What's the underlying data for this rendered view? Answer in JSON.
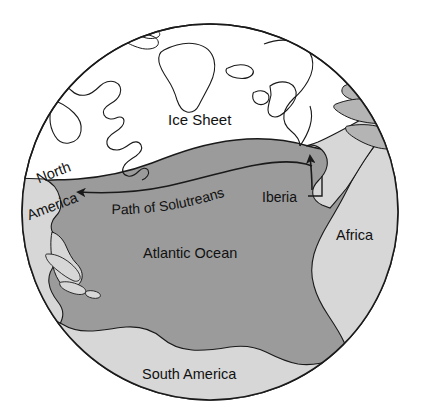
{
  "figure": {
    "kind": "globe-map",
    "projection": "orthographic",
    "view_center": "North Atlantic Ocean",
    "background_color": "#ffffff",
    "outline_color": "#1a1a1a"
  },
  "colors": {
    "ocean": "#9b9b9b",
    "land": "#d7d7d7",
    "ice_sheet": "#ffffff",
    "outline": "#1a1a1a",
    "label_text": "#111111"
  },
  "labels": {
    "ice_sheet": "Ice Sheet",
    "atlantic_ocean": "Atlantic Ocean",
    "south_america": "South America",
    "africa": "Africa",
    "iberia": "Iberia",
    "north_america_line1": "North",
    "north_america_line2": "America",
    "path_of_solutreans": "Path of Solutreans"
  },
  "features": {
    "ice_sheet": {
      "name": "Ice Sheet",
      "fill": "#ffffff",
      "description": "Last Glacial Maximum ice sheet spanning the northern North Atlantic"
    },
    "ocean": {
      "name": "Atlantic Ocean",
      "fill": "#9b9b9b"
    },
    "landmasses": [
      {
        "name": "North America",
        "fill": "#d7d7d7"
      },
      {
        "name": "South America",
        "fill": "#d7d7d7"
      },
      {
        "name": "Africa",
        "fill": "#d7d7d7"
      },
      {
        "name": "Iberia",
        "fill": "#d7d7d7"
      }
    ],
    "migration_route": {
      "name": "Path of Solutreans",
      "from": "Iberia",
      "to": "North America",
      "direction": "east-to-west",
      "arrowheads": 2,
      "style": "solid line with arrowheads at both ends"
    }
  },
  "geometry": {
    "globe_center_x": 210,
    "globe_center_y": 212,
    "globe_radius": 188
  }
}
